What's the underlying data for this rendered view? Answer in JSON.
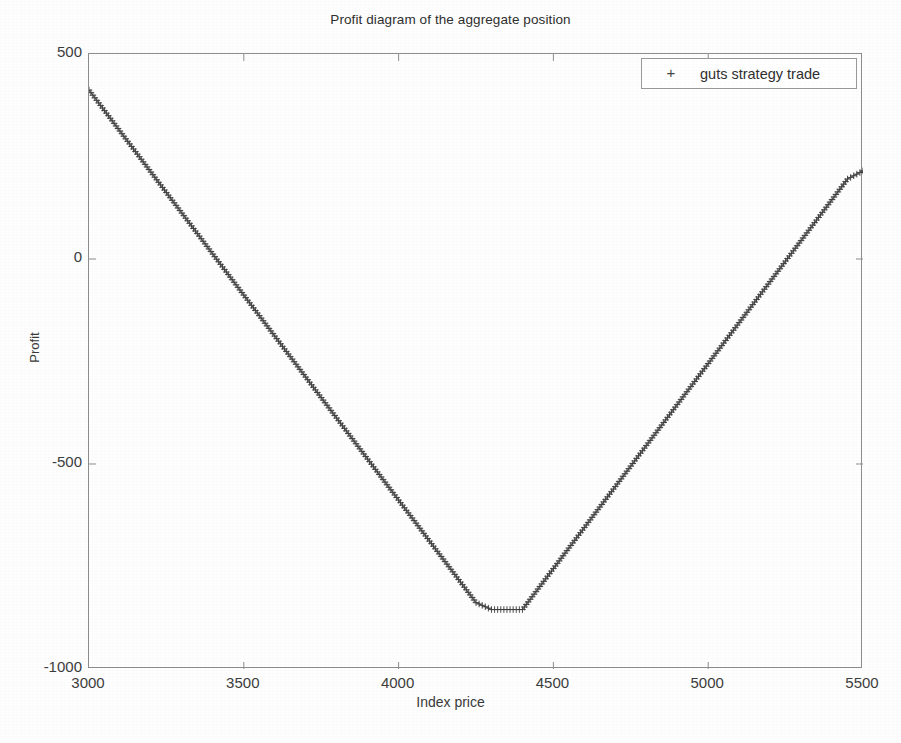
{
  "figure": {
    "title": "Profit diagram of the aggregate position",
    "background_color": "#fefefe",
    "axis_color": "#8d8d8d",
    "series_color": "#3c3c3c"
  },
  "legend": {
    "position": "top-right",
    "marker_glyph": "+",
    "entries": [
      {
        "label": "guts strategy trade",
        "marker": "+"
      }
    ]
  },
  "axes": {
    "x_label": "Index price",
    "y_label": "Profit",
    "x_ticks": [
      "3000",
      "3500",
      "4000",
      "4500",
      "5000",
      "5500"
    ],
    "y_ticks": [
      "500",
      "0",
      "-500",
      "-1000"
    ]
  },
  "chart_data": {
    "type": "line",
    "title": "Profit diagram of the aggregate position",
    "xlabel": "Index price",
    "ylabel": "Profit",
    "xlim": [
      3000,
      5500
    ],
    "ylim": [
      -1000,
      500
    ],
    "xticks": [
      3000,
      3500,
      4000,
      4500,
      5000,
      5500
    ],
    "yticks": [
      500,
      0,
      -500,
      -1000
    ],
    "grid": false,
    "legend_position": "upper right",
    "marker": "+",
    "series": [
      {
        "name": "guts strategy trade",
        "marker": "+",
        "color": "#3c3c3c",
        "x": [
          3000,
          3050,
          3100,
          3150,
          3200,
          3250,
          3300,
          3350,
          3400,
          3450,
          3500,
          3550,
          3600,
          3650,
          3700,
          3750,
          3800,
          3850,
          3900,
          3950,
          4000,
          4050,
          4100,
          4150,
          4200,
          4250,
          4300,
          4350,
          4400,
          4450,
          4500,
          4550,
          4600,
          4650,
          4700,
          4750,
          4800,
          4850,
          4900,
          4950,
          5000,
          5050,
          5100,
          5150,
          5200,
          5250,
          5300,
          5350,
          5400,
          5450,
          5500
        ],
        "y": [
          412,
          362,
          312,
          262,
          212,
          162,
          112,
          62,
          12,
          -38,
          -88,
          -138,
          -188,
          -238,
          -288,
          -338,
          -388,
          -438,
          -488,
          -538,
          -588,
          -638,
          -688,
          -738,
          -788,
          -838,
          -855,
          -855,
          -855,
          -805,
          -755,
          -705,
          -655,
          -605,
          -555,
          -505,
          -455,
          -405,
          -355,
          -305,
          -255,
          -205,
          -155,
          -105,
          -55,
          -5,
          45,
          95,
          145,
          195,
          215
        ]
      }
    ],
    "annotations": [
      {
        "text": "minimum profit plateau",
        "x_range": [
          4250,
          4450
        ],
        "y": -855
      }
    ]
  }
}
